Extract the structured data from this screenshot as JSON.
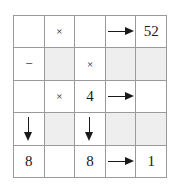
{
  "colors": {
    "grid_line": "#9a9a9a",
    "shaded_cell": "#eeeeee",
    "cell_background": "#ffffff",
    "ink": "#1a1a1a"
  },
  "grid": {
    "rows": 5,
    "columns": 5,
    "cells": [
      [
        {
          "name": "cell-r1c1",
          "type": "empty",
          "text": "",
          "shaded": false
        },
        {
          "name": "cell-r1c2",
          "type": "operator",
          "text": "×",
          "shaded": false
        },
        {
          "name": "cell-r1c3",
          "type": "empty",
          "text": "",
          "shaded": false
        },
        {
          "name": "cell-r1c4",
          "type": "arrow-right",
          "text": "",
          "shaded": false
        },
        {
          "name": "cell-r1c5",
          "type": "number",
          "text": "52",
          "shaded": false
        }
      ],
      [
        {
          "name": "cell-r2c1",
          "type": "operator",
          "text": "−",
          "shaded": false
        },
        {
          "name": "cell-r2c2",
          "type": "empty",
          "text": "",
          "shaded": true
        },
        {
          "name": "cell-r2c3",
          "type": "operator",
          "text": "×",
          "shaded": false
        },
        {
          "name": "cell-r2c4",
          "type": "empty",
          "text": "",
          "shaded": true
        },
        {
          "name": "cell-r2c5",
          "type": "empty",
          "text": "",
          "shaded": true
        }
      ],
      [
        {
          "name": "cell-r3c1",
          "type": "empty",
          "text": "",
          "shaded": false
        },
        {
          "name": "cell-r3c2",
          "type": "operator",
          "text": "×",
          "shaded": false
        },
        {
          "name": "cell-r3c3",
          "type": "number",
          "text": "4",
          "shaded": false
        },
        {
          "name": "cell-r3c4",
          "type": "arrow-right",
          "text": "",
          "shaded": false
        },
        {
          "name": "cell-r3c5",
          "type": "empty",
          "text": "",
          "shaded": false
        }
      ],
      [
        {
          "name": "cell-r4c1",
          "type": "arrow-down",
          "text": "",
          "shaded": false
        },
        {
          "name": "cell-r4c2",
          "type": "empty",
          "text": "",
          "shaded": true
        },
        {
          "name": "cell-r4c3",
          "type": "arrow-down",
          "text": "",
          "shaded": false
        },
        {
          "name": "cell-r4c4",
          "type": "empty",
          "text": "",
          "shaded": true
        },
        {
          "name": "cell-r4c5",
          "type": "empty",
          "text": "",
          "shaded": true
        }
      ],
      [
        {
          "name": "cell-r5c1",
          "type": "number",
          "text": "8",
          "shaded": false
        },
        {
          "name": "cell-r5c2",
          "type": "empty",
          "text": "",
          "shaded": false
        },
        {
          "name": "cell-r5c3",
          "type": "number",
          "text": "8",
          "shaded": false
        },
        {
          "name": "cell-r5c4",
          "type": "arrow-right",
          "text": "",
          "shaded": false
        },
        {
          "name": "cell-r5c5",
          "type": "number",
          "text": "1",
          "shaded": false
        }
      ]
    ]
  }
}
